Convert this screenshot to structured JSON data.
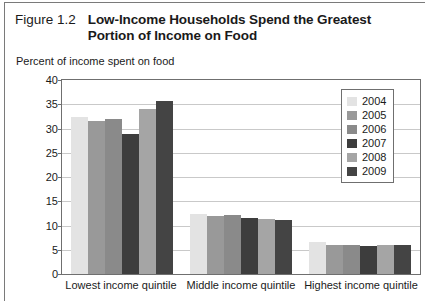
{
  "figure": {
    "number": "Figure 1.2",
    "title": "Low-Income Households Spend the Greatest Portion of Income on Food",
    "subtitle": "Percent of income spent on food"
  },
  "legend": {
    "position": "inside-top-right",
    "entries": [
      {
        "label": "2004",
        "color": "#e3e3e3"
      },
      {
        "label": "2005",
        "color": "#999999"
      },
      {
        "label": "2006",
        "color": "#8a8a8a"
      },
      {
        "label": "2007",
        "color": "#3d3d3d"
      },
      {
        "label": "2008",
        "color": "#a5a5a5"
      },
      {
        "label": "2009",
        "color": "#444444"
      }
    ]
  },
  "chart_data": {
    "type": "bar",
    "title": "Low-Income Households Spend the Greatest Portion of Income on Food",
    "subtitle": "Percent of income spent on food",
    "xlabel": "",
    "ylabel": "Percent of income spent on food",
    "ylim": [
      0,
      40
    ],
    "yticks": [
      0,
      5,
      10,
      15,
      20,
      25,
      30,
      35,
      40
    ],
    "grid": true,
    "categories": [
      "Lowest income quintile",
      "Middle income quintile",
      "Highest income quintile"
    ],
    "series": [
      {
        "name": "2004",
        "color": "#e3e3e3",
        "values": [
          32.4,
          12.4,
          6.5
        ]
      },
      {
        "name": "2005",
        "color": "#999999",
        "values": [
          31.6,
          11.9,
          5.9
        ]
      },
      {
        "name": "2006",
        "color": "#8a8a8a",
        "values": [
          32.0,
          12.2,
          5.9
        ]
      },
      {
        "name": "2007",
        "color": "#3d3d3d",
        "values": [
          28.8,
          11.5,
          5.7
        ]
      },
      {
        "name": "2008",
        "color": "#a5a5a5",
        "values": [
          34.0,
          11.3,
          6.0
        ]
      },
      {
        "name": "2009",
        "color": "#444444",
        "values": [
          35.7,
          11.2,
          5.9
        ]
      }
    ]
  }
}
